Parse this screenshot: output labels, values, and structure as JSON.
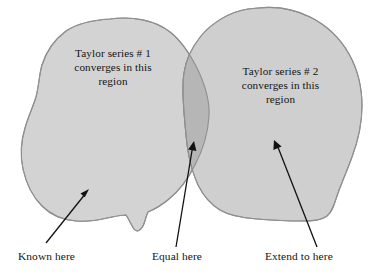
{
  "figure": {
    "background_color": "#ffffff",
    "width": 380,
    "height": 279
  },
  "regions": [
    {
      "id": "region-1",
      "name": "Taylor series 1 region",
      "label": "Taylor series # 1\nconverges in this\nregion",
      "fill_color": "#d3d3d3",
      "stroke_color": "#8f8f8f"
    },
    {
      "id": "region-2",
      "name": "Taylor series 2 region",
      "label": "Taylor series # 2\nconverges in this\nregion",
      "fill_color": "#cfcfcf",
      "stroke_color": "#8f8f8f"
    },
    {
      "id": "overlap",
      "name": "Overlap region",
      "label": "",
      "fill_color": "#b6b6b6",
      "stroke_color": "#8f8f8f"
    }
  ],
  "annotations": [
    {
      "id": "known",
      "caption": "Known here",
      "arrow_from": {
        "x": 46,
        "y": 243
      },
      "arrow_to": {
        "x": 89,
        "y": 190
      }
    },
    {
      "id": "equal",
      "caption": "Equal here",
      "arrow_from": {
        "x": 176,
        "y": 247
      },
      "arrow_to": {
        "x": 194,
        "y": 142
      }
    },
    {
      "id": "extend",
      "caption": "Extend to here",
      "arrow_from": {
        "x": 317,
        "y": 247
      },
      "arrow_to": {
        "x": 274,
        "y": 141
      }
    }
  ],
  "colors": {
    "arrow": "#111111",
    "text": "#141414",
    "light_fill": "#d3d3d3",
    "dark_fill": "#b6b6b6",
    "outline": "#8f8f8f"
  }
}
